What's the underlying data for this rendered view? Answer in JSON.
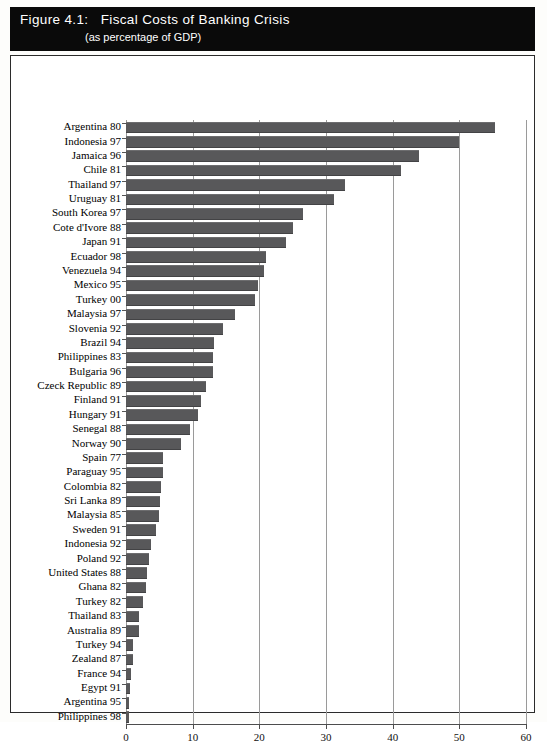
{
  "figure": {
    "label": "Figure 4.1:",
    "title": "Fiscal Costs of Banking Crisis",
    "subtitle": "(as percentage of GDP)"
  },
  "chart_data": {
    "type": "bar",
    "orientation": "horizontal",
    "title": "Fiscal Costs of Banking Crisis",
    "subtitle": "(as percentage of GDP)",
    "xlabel": "",
    "ylabel": "",
    "xlim": [
      0,
      60
    ],
    "xticks": [
      0,
      10,
      20,
      30,
      40,
      50,
      60
    ],
    "tick_labels": [
      "0",
      "10",
      "20",
      "30",
      "40",
      "50",
      "60"
    ],
    "grid": true,
    "grid_axis": "x",
    "legend": false,
    "bar_color": "#58585a",
    "categories": [
      "Argentina 80",
      "Indonesia 97",
      "Jamaica 96",
      "Chile 81",
      "Thailand 97",
      "Uruguay 81",
      "South Korea 97",
      "Cote d'Ivore 88",
      "Japan 91",
      "Ecuador 98",
      "Venezuela 94",
      "Mexico 95",
      "Turkey 00",
      "Malaysia 97",
      "Slovenia 92",
      "Brazil 94",
      "Philippines 83",
      "Bulgaria 96",
      "Czeck Republic 89",
      "Finland 91",
      "Hungary 91",
      "Senegal 88",
      "Norway 90",
      "Spain 77",
      "Paraguay 95",
      "Colombia 82",
      "Sri Lanka 89",
      "Malaysia 85",
      "Sweden 91",
      "Indonesia 92",
      "Poland 92",
      "United States 88",
      "Ghana 82",
      "Turkey 82",
      "Thailand 83",
      "Australia 89",
      "Turkey 94",
      "Zealand 87",
      "France 94",
      "Egypt 91",
      "Argentina 95",
      "Philippines 98"
    ],
    "values": [
      55.3,
      50.0,
      44.0,
      41.2,
      32.8,
      31.2,
      26.5,
      25.0,
      24.0,
      21.0,
      20.7,
      19.8,
      19.3,
      16.4,
      14.6,
      13.2,
      13.0,
      13.0,
      12.0,
      11.2,
      10.8,
      9.6,
      8.2,
      5.6,
      5.5,
      5.3,
      5.1,
      4.9,
      4.5,
      3.8,
      3.5,
      3.2,
      3.0,
      2.6,
      2.0,
      1.9,
      1.1,
      1.0,
      0.7,
      0.6,
      0.5,
      0.5
    ]
  }
}
